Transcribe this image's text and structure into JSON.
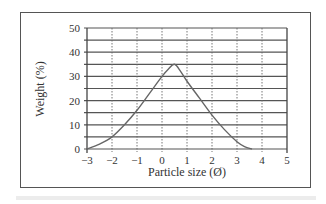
{
  "chart_data": {
    "type": "line",
    "title": "",
    "xlabel": "Particle size (Ø)",
    "ylabel": "Weight (%)",
    "xlim": [
      -3,
      5
    ],
    "ylim": [
      0,
      50
    ],
    "x_ticks": [
      "-3",
      "-2",
      "-1",
      "0",
      "1",
      "2",
      "3",
      "4",
      "5"
    ],
    "y_ticks": [
      "0",
      "10",
      "20",
      "30",
      "40",
      "50"
    ],
    "grid": {
      "horizontal": "solid every 5",
      "vertical": "dotted every 1"
    },
    "legend": null,
    "series": [
      {
        "name": "Weight distribution",
        "x": [
          -3,
          -2.5,
          -2,
          -1.5,
          -1,
          -0.5,
          0,
          0.25,
          0.5,
          0.75,
          1,
          1.5,
          2,
          2.5,
          3,
          3.3,
          3.6
        ],
        "y": [
          0,
          2,
          5,
          10,
          16,
          23,
          30,
          33,
          35,
          32,
          28,
          21,
          14,
          8,
          3,
          1,
          0
        ]
      }
    ],
    "colors": {
      "line": "#666666",
      "grid": "#555555",
      "frame": "#555555"
    }
  }
}
